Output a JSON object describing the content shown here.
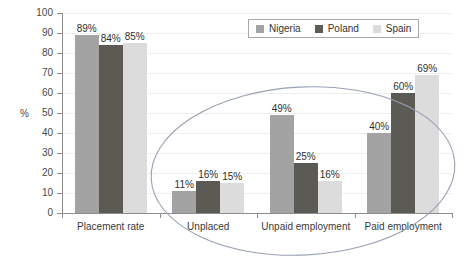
{
  "chart_data": {
    "type": "bar",
    "title": "",
    "xlabel": "",
    "ylabel": "%",
    "ylim": [
      0,
      100
    ],
    "ytick_step": 10,
    "yticks": [
      100,
      90,
      80,
      70,
      60,
      50,
      40,
      30,
      20,
      10,
      0
    ],
    "grid": true,
    "legend_position": "top-right",
    "categories": [
      "Placement rate",
      "Unplaced",
      "Unpaid employment",
      "Paid employment"
    ],
    "series": [
      {
        "name": "Nigeria",
        "color": "#a3a3a3",
        "values": [
          89,
          11,
          49,
          40
        ],
        "labels": [
          "89%",
          "11%",
          "49%",
          "40%"
        ]
      },
      {
        "name": "Poland",
        "color": "#5c5a55",
        "values": [
          84,
          16,
          25,
          60
        ],
        "labels": [
          "84%",
          "16%",
          "25%",
          "60%"
        ]
      },
      {
        "name": "Spain",
        "color": "#dcdcdc",
        "values": [
          85,
          15,
          16,
          69
        ],
        "labels": [
          "85%",
          "15%",
          "16%",
          "69%"
        ]
      }
    ],
    "annotations": [
      {
        "type": "ellipse",
        "shape": "hand-drawn-oval",
        "color": "#98a0b4",
        "encircles": [
          "Unplaced",
          "Unpaid employment",
          "Paid employment"
        ]
      }
    ]
  }
}
